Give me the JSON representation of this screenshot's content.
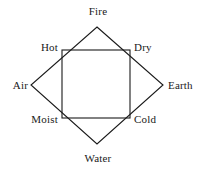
{
  "diagram": {
    "stroke_color": "#1a1a1a",
    "background_color": "#ffffff",
    "elements": [
      {
        "key": "fire",
        "label": "Fire",
        "position": "top"
      },
      {
        "key": "air",
        "label": "Air",
        "position": "left"
      },
      {
        "key": "earth",
        "label": "Earth",
        "position": "right"
      },
      {
        "key": "water",
        "label": "Water",
        "position": "bottom"
      }
    ],
    "qualities": [
      {
        "key": "hot",
        "label": "Hot",
        "position": "top-left"
      },
      {
        "key": "dry",
        "label": "Dry",
        "position": "top-right"
      },
      {
        "key": "moist",
        "label": "Moist",
        "position": "bottom-left"
      },
      {
        "key": "cold",
        "label": "Cold",
        "position": "bottom-right"
      }
    ],
    "shapes": {
      "diamond": {
        "name": "elements-diamond",
        "points": "97,27 163,85 97,144 31,85"
      },
      "square": {
        "name": "qualities-square",
        "x": 62,
        "y": 50,
        "width": 68,
        "height": 68
      }
    }
  }
}
